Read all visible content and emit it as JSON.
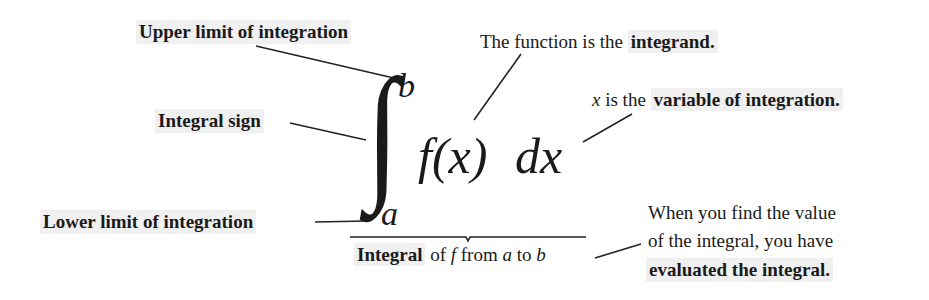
{
  "formula": {
    "integral_sign": "∫",
    "upper_limit": "b",
    "lower_limit": "a",
    "integrand": "f(x)",
    "differential": "dx"
  },
  "labels": {
    "upper_limit": "Upper limit of integration",
    "integral_sign": "Integral sign",
    "lower_limit": "Lower limit of integration",
    "integrand_prefix": "The function is the ",
    "integrand_bold": "integrand.",
    "variable_x": "x",
    "variable_mid": " is the ",
    "variable_bold": "variable of integration.",
    "integral_bold": "Integral",
    "integral_of": " of ",
    "integral_f": "f",
    "integral_from": " from ",
    "integral_a": "a",
    "integral_to": " to ",
    "integral_b": "b",
    "evaluated_line1": "When you find the value",
    "evaluated_line2": "of the integral, you have",
    "evaluated_bold": "evaluated the integral."
  },
  "colors": {
    "text": "#1a1a1a",
    "highlight": "#f0f0f0",
    "background": "#ffffff"
  }
}
